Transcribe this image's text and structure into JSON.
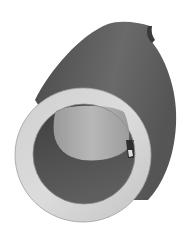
{
  "image": {
    "subject": "3D rendered mechanical bushing with internal keyway",
    "style": "grayscale shaded render",
    "colors": {
      "background": "#ffffff",
      "body_dark": "#5a5a5a",
      "body_mid": "#6e6e6e",
      "ring_face": "#d6d6d6",
      "bore_dark": "#4f4f4f",
      "bore_light": "#a8a8a8"
    }
  }
}
